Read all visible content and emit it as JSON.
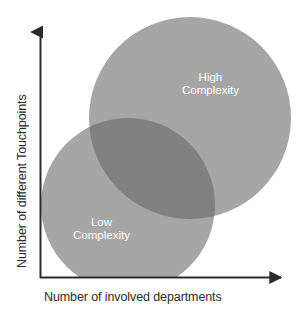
{
  "figure": {
    "background_color": "#ffffff"
  },
  "axes": {
    "x_label": "Number of involved departments",
    "y_label": "Number of different Touchpoints",
    "axis_color": "#2b2b2b",
    "origin_x": 40,
    "origin_y": 277,
    "x_end": 287,
    "y_end": 27,
    "x_arrowhead": "arrow-right-icon",
    "y_arrowhead": "arrow-up-icon"
  },
  "chart_data": {
    "type": "scatter",
    "title": "",
    "xlabel": "Number of involved departments",
    "ylabel": "Number of different Touchpoints",
    "grid": false,
    "legend": "none",
    "series": [
      {
        "name": "High Complexity",
        "shape": "circle",
        "center_x": 190,
        "center_y": 118,
        "radius": 101,
        "fill": "#a6a6a6",
        "label": "High Complexity",
        "label_color": "#ffffff"
      },
      {
        "name": "Low Complexity",
        "shape": "circle",
        "center_x": 128,
        "center_y": 205,
        "radius": 87,
        "fill": "#a6a6a6",
        "label": "Low Complexity",
        "label_color": "#ffffff",
        "clipped_at_x_axis": true
      }
    ],
    "overlap": {
      "fill": "#808080",
      "blend": "multiply"
    }
  },
  "labels": {
    "high": {
      "line1": "High",
      "line2": "Complexity"
    },
    "low": {
      "line1": "Low",
      "line2": "Complexity"
    }
  },
  "colors": {
    "circle_fill": "#a6a6a6",
    "overlap_fill": "#808080",
    "axis": "#2b2b2b",
    "label_text": "#ffffff",
    "caption_text": "#2b2b2b"
  }
}
